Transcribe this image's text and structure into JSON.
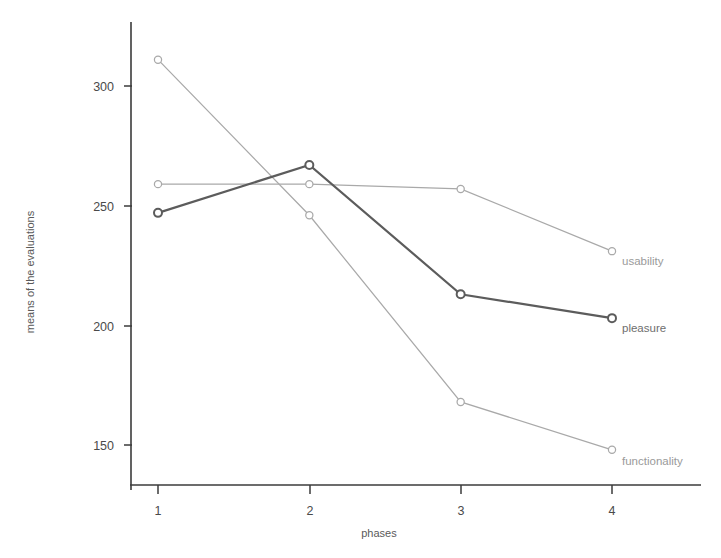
{
  "chart_data": {
    "type": "line",
    "title": "",
    "xlabel": "phases",
    "ylabel": "means of the evaluations",
    "categories": [
      "1",
      "2",
      "3",
      "4"
    ],
    "x": [
      1,
      2,
      3,
      4
    ],
    "xlim": [
      0.6,
      4.45
    ],
    "ylim": [
      137,
      320
    ],
    "yticks": [
      150,
      200,
      250,
      300
    ],
    "ytick_labels": [
      "150",
      "200",
      "250",
      "300"
    ],
    "xticks": [
      1,
      2,
      3,
      4
    ],
    "xtick_labels": [
      "1",
      "2",
      "3",
      "4"
    ],
    "grid": false,
    "legend_position": "right-inline-end-of-line",
    "series": [
      {
        "name": "functionality",
        "label": "functionality",
        "color": "#a9a9a9",
        "line_width": 1.25,
        "marker": "circle-open",
        "values": [
          311,
          246,
          168,
          148
        ]
      },
      {
        "name": "usability",
        "label": "usability",
        "color": "#a9a9a9",
        "line_width": 1.25,
        "marker": "circle-open",
        "values": [
          259,
          259,
          257,
          231
        ]
      },
      {
        "name": "pleasure",
        "label": "pleasure",
        "color": "#5c5c5c",
        "line_width": 2.2,
        "marker": "circle-open",
        "values": [
          247,
          267,
          213,
          203
        ]
      }
    ]
  },
  "axes": {
    "y_tick_color": "#4a4a4a",
    "axis_color": "#3b3b3b",
    "x_axis_title": "phases",
    "y_axis_title": "means of the evaluations"
  },
  "labels": {
    "usability": "usability",
    "pleasure": "pleasure",
    "functionality": "functionality"
  }
}
